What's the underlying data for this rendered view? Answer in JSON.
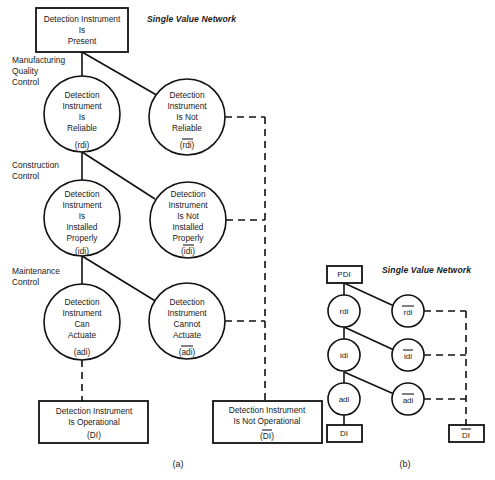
{
  "figure": {
    "title_a": "Single Value Network",
    "title_b": "Single Value Network",
    "caption_a": "(a)",
    "caption_b": "(b)"
  },
  "diagram_a": {
    "root_box": {
      "line1": "Detection Instrument",
      "line2": "Is",
      "line3": "Present"
    },
    "tier_labels": [
      {
        "line1": "Manufacturing",
        "line2": "Quality",
        "line3": "Control"
      },
      {
        "line1": "Construction",
        "line2": "Control",
        "line3": ""
      },
      {
        "line1": "Maintenance",
        "line2": "Control",
        "line3": ""
      }
    ],
    "nodes": [
      {
        "id": "rdi",
        "line1": "Detection",
        "line2": "Instrument",
        "line3": "Is",
        "line4": "Reliable",
        "code": "(rdi)",
        "negated": false
      },
      {
        "id": "rdi-bar",
        "line1": "Detection",
        "line2": "Instrument",
        "line3": "Is Not",
        "line4": "Reliable",
        "code": "(rdi)",
        "negated": true
      },
      {
        "id": "idi",
        "line1": "Detection",
        "line2": "Instrument",
        "line3": "Is",
        "line4": "Installed",
        "line5": "Properly",
        "code": "(idi)",
        "negated": false
      },
      {
        "id": "idi-bar",
        "line1": "Detection",
        "line2": "Instrument",
        "line3": "Is Not",
        "line4": "Installed",
        "line5": "Properly",
        "code": "(idi)",
        "negated": true
      },
      {
        "id": "adi",
        "line1": "Detection",
        "line2": "Instrument",
        "line3": "Can",
        "line4": "Actuate",
        "code": "(adi)",
        "negated": false
      },
      {
        "id": "adi-bar",
        "line1": "Detection",
        "line2": "Instrument",
        "line3": "Cannot",
        "line4": "Actuate",
        "code": "(adi)",
        "negated": true
      }
    ],
    "outcome_boxes": [
      {
        "id": "DI",
        "line1": "Detection Instrument",
        "line2": "Is Operational",
        "code": "(DI)",
        "negated": false
      },
      {
        "id": "DI-bar",
        "line1": "Detection Instrument",
        "line2": "Is Not Operational",
        "code": "(DI)",
        "negated": true
      }
    ]
  },
  "diagram_b": {
    "root_box": {
      "label": "PDI"
    },
    "left_nodes": [
      {
        "label": "rdi",
        "negated": false
      },
      {
        "label": "idi",
        "negated": false
      },
      {
        "label": "adi",
        "negated": false
      }
    ],
    "right_nodes": [
      {
        "label": "rdi",
        "negated": true
      },
      {
        "label": "idi",
        "negated": true
      },
      {
        "label": "adi",
        "negated": true
      }
    ],
    "outcome_boxes": [
      {
        "label": "DI",
        "negated": false
      },
      {
        "label": "DI",
        "negated": true
      }
    ]
  }
}
